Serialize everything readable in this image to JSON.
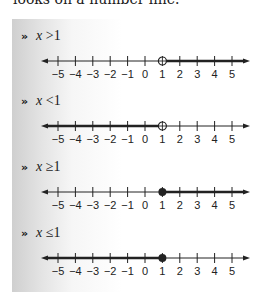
{
  "intro_text": "looks on a number line.",
  "bullet_glyph": "»",
  "colors": {
    "line": "#222222",
    "panel_gradient_start": "#cfcfcf",
    "panel_gradient_end": "#ffffff"
  },
  "number_line": {
    "ticks": [
      "−5",
      "−4",
      "−3",
      "−2",
      "−1",
      "0",
      "1",
      "2",
      "3",
      "4",
      "5"
    ],
    "tick_values": [
      -5,
      -4,
      -3,
      -2,
      -1,
      0,
      1,
      2,
      3,
      4,
      5
    ]
  },
  "items": [
    {
      "variable": "x",
      "operator": ">",
      "value": "1",
      "endpoint": "open",
      "direction": "right"
    },
    {
      "variable": "x",
      "operator": "<",
      "value": "1",
      "endpoint": "open",
      "direction": "left"
    },
    {
      "variable": "x",
      "operator": "≥",
      "value": "1",
      "endpoint": "closed",
      "direction": "right"
    },
    {
      "variable": "x",
      "operator": "≤",
      "value": "1",
      "endpoint": "closed",
      "direction": "left"
    }
  ]
}
